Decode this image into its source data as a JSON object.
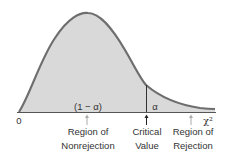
{
  "diagram": {
    "origin_label": "0",
    "axis_label": "χ²",
    "nonrejection_area_label": "(1 − α)",
    "rejection_area_label": "α",
    "annotations": [
      {
        "line1": "Region of",
        "line2": "Nonrejection"
      },
      {
        "line1": "Critical",
        "line2": "Value"
      },
      {
        "line1": "Region of",
        "line2": "Rejection"
      }
    ],
    "colors": {
      "fill": "#d9d9d9",
      "curve": "#6e6e6e",
      "axis": "#555555",
      "arrow_light": "#aaaaaa",
      "arrow_dark": "#222222"
    }
  }
}
